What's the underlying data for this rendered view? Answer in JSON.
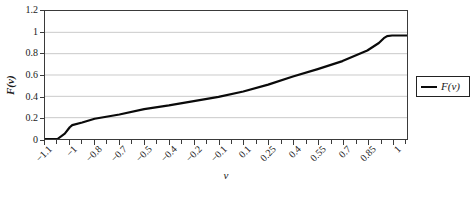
{
  "chart_data": {
    "type": "line",
    "title": "",
    "xlabel": "v",
    "ylabel": "F(v)",
    "ylim": [
      0,
      1.2
    ],
    "grid": true,
    "x_axis_type": "category",
    "x_tick_labels": [
      "-1.1",
      "-1",
      "-0.8",
      "-0.7",
      "-0.5",
      "-0.4",
      "-0.2",
      "-0.1",
      "0.1",
      "0.25",
      "0.4",
      "0.55",
      "0.7",
      "0.85",
      "1"
    ],
    "y_tick_labels": [
      "0",
      "0.2",
      "0.4",
      "0.6",
      "0.8",
      "1",
      "1.2"
    ],
    "legend": {
      "position": "right",
      "entries": [
        {
          "label": "F(v)",
          "color": "#0a0a0a"
        }
      ]
    },
    "series": [
      {
        "name": "F(v)",
        "points": [
          [
            -1.1,
            0.0
          ],
          [
            -1.05,
            0.0
          ],
          [
            -1.02,
            0.05
          ],
          [
            -1.0,
            0.11
          ],
          [
            -0.98,
            0.13
          ],
          [
            -0.9,
            0.155
          ],
          [
            -0.8,
            0.19
          ],
          [
            -0.7,
            0.23
          ],
          [
            -0.5,
            0.28
          ],
          [
            -0.4,
            0.315
          ],
          [
            -0.2,
            0.355
          ],
          [
            -0.1,
            0.395
          ],
          [
            0.1,
            0.445
          ],
          [
            0.25,
            0.51
          ],
          [
            0.4,
            0.585
          ],
          [
            0.55,
            0.655
          ],
          [
            0.7,
            0.73
          ],
          [
            0.85,
            0.83
          ],
          [
            0.92,
            0.9
          ],
          [
            0.95,
            0.945
          ],
          [
            0.97,
            0.965
          ],
          [
            1.0,
            0.97
          ]
        ]
      }
    ]
  },
  "colors": {
    "curve": "#0a0a0a",
    "grid": "#c9c9c9",
    "frame": "#3a3a3a",
    "text": "#1a1a1a",
    "background": "#ffffff"
  }
}
